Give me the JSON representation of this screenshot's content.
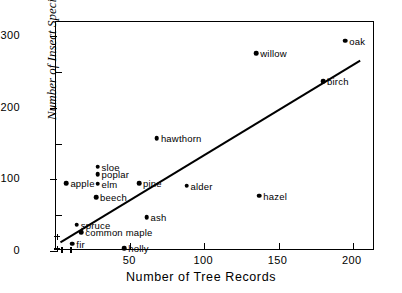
{
  "chart_data": {
    "type": "scatter",
    "title": "",
    "xlabel": "Number of Tree Records",
    "ylabel": "Number of Insect Species",
    "xlim": [
      0,
      215
    ],
    "ylim": [
      0,
      320
    ],
    "xticks": [
      50,
      100,
      150,
      200
    ],
    "yticks": [
      0,
      100,
      200,
      300
    ],
    "xminorticks": [
      25,
      75,
      125,
      175
    ],
    "yminorticks": [
      50,
      150,
      250
    ],
    "grid": false,
    "legend": "none",
    "points": [
      {
        "label": "apple",
        "x": 7,
        "y": 95,
        "marker": "dot",
        "label_pos": "right"
      },
      {
        "label": "sloe",
        "x": 28,
        "y": 118,
        "marker": "dot",
        "label_pos": "right"
      },
      {
        "label": "poplar",
        "x": 28,
        "y": 107,
        "marker": "dot",
        "label_pos": "right"
      },
      {
        "label": "elm",
        "x": 28,
        "y": 94,
        "marker": "dot",
        "label_pos": "right"
      },
      {
        "label": "beech",
        "x": 27,
        "y": 75,
        "marker": "dot",
        "label_pos": "right"
      },
      {
        "label": "pine",
        "x": 56,
        "y": 95,
        "marker": "dot",
        "label_pos": "right"
      },
      {
        "label": "alder",
        "x": 88,
        "y": 91,
        "marker": "dot",
        "label_pos": "right"
      },
      {
        "label": "hawthorn",
        "x": 68,
        "y": 158,
        "marker": "dot",
        "label_pos": "right"
      },
      {
        "label": "hazel",
        "x": 137,
        "y": 77,
        "marker": "dot",
        "label_pos": "right"
      },
      {
        "label": "willow",
        "x": 135,
        "y": 276,
        "marker": "dot",
        "label_pos": "right"
      },
      {
        "label": "oak",
        "x": 195,
        "y": 294,
        "marker": "dot",
        "label_pos": "right"
      },
      {
        "label": "birch",
        "x": 180,
        "y": 237,
        "marker": "dot",
        "label_pos": "right"
      },
      {
        "label": "ash",
        "x": 61,
        "y": 47,
        "marker": "dot",
        "label_pos": "right"
      },
      {
        "label": "spruce",
        "x": 14,
        "y": 37,
        "marker": "dot",
        "label_pos": "right"
      },
      {
        "label": "common maple",
        "x": 17,
        "y": 26,
        "marker": "dot",
        "label_pos": "right"
      },
      {
        "label": "fir",
        "x": 11,
        "y": 10,
        "marker": "dot",
        "label_pos": "right"
      },
      {
        "label": "holly",
        "x": 46,
        "y": 4,
        "marker": "dot",
        "label_pos": "right"
      },
      {
        "label": "",
        "x": 1,
        "y": 20,
        "marker": "plus",
        "label_pos": "none"
      },
      {
        "label": "",
        "x": 1,
        "y": 3,
        "marker": "plus",
        "label_pos": "none"
      },
      {
        "label": "",
        "x": 4,
        "y": 2,
        "marker": "plus",
        "label_pos": "none"
      },
      {
        "label": "",
        "x": 10,
        "y": 2,
        "marker": "plus",
        "label_pos": "none"
      }
    ],
    "fit_line": {
      "x1": 3,
      "y1": 12,
      "x2": 205,
      "y2": 266,
      "style": "solid"
    }
  }
}
